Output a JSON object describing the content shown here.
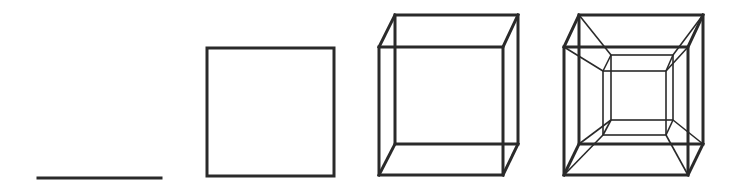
{
  "diagram": {
    "stroke_color": "#2a2a2a",
    "background": "#ffffff",
    "figures": [
      {
        "name": "line-segment",
        "dimension": 1
      },
      {
        "name": "square",
        "dimension": 2
      },
      {
        "name": "cube",
        "dimension": 3
      },
      {
        "name": "tesseract",
        "dimension": 4
      }
    ]
  }
}
